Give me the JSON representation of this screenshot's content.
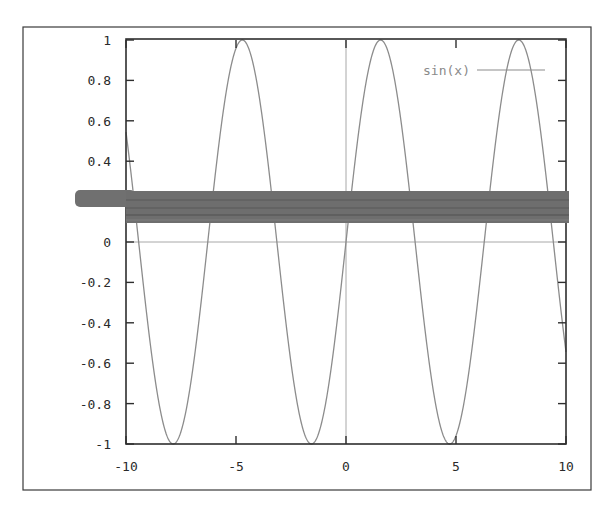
{
  "chart_data": {
    "type": "line",
    "title": "",
    "xlabel": "",
    "ylabel": "",
    "xlim": [
      -10,
      10
    ],
    "ylim": [
      -1,
      1
    ],
    "grid": false,
    "zero_axes": true,
    "legend_position": "top-right",
    "x_ticks": [
      -10,
      -5,
      0,
      5,
      10
    ],
    "x_tick_labels": [
      "-10",
      "-5",
      "0",
      "5",
      "10"
    ],
    "y_ticks": [
      1,
      0.8,
      0.6,
      0.4,
      0.2,
      0,
      -0.2,
      -0.4,
      -0.6,
      -0.8,
      -1
    ],
    "y_tick_labels": [
      "1",
      "0.8",
      "0.6",
      "0.4",
      "0.2",
      "0",
      "-0.2",
      "-0.4",
      "-0.6",
      "-0.8",
      "-1"
    ],
    "series": [
      {
        "name": "sin(x)",
        "function": "sin(x)",
        "color": "#8c8c8c",
        "x": [
          -10,
          -9,
          -8,
          -7,
          -6,
          -5,
          -4,
          -3,
          -2,
          -1,
          0,
          1,
          2,
          3,
          4,
          5,
          6,
          7,
          8,
          9,
          10
        ],
        "values": [
          0.544,
          -0.412,
          -0.989,
          -0.657,
          0.279,
          0.959,
          0.757,
          -0.141,
          -0.909,
          -0.841,
          0,
          0.841,
          0.909,
          0.141,
          -0.757,
          -0.959,
          -0.279,
          0.657,
          0.989,
          0.412,
          -0.544
        ]
      }
    ],
    "annotations": [
      "Gray horizontal redaction band occluding the 0.2 tick region (y ≈ 0.1–0.25) across the plot"
    ]
  },
  "legend": {
    "label": "sin(x)"
  },
  "colors": {
    "frame": "#3a3a3a",
    "curve": "#8c8c8c",
    "band": "#6e6e6e",
    "axis_zero": "#a8a8a8"
  }
}
